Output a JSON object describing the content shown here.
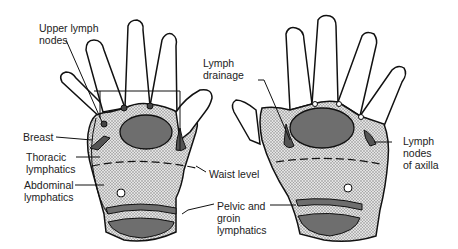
{
  "diagram": {
    "left_hand_labels": {
      "upper_lymph_nodes": "Upper lymph\nnodes",
      "breast": "Breast",
      "thoracic_lymphatics": "Thoracic\nlymphatics",
      "abdominal_lymphatics": "Abdominal\nlymphatics"
    },
    "center_labels": {
      "lymph_drainage": "Lymph\ndrainage",
      "waist_level": "Waist level",
      "pelvic_groin": "Pelvic and\ngroin\nlymphatics"
    },
    "right_hand_labels": {
      "lymph_nodes_axilla": "Lymph\nnodes\nof axilla"
    },
    "colors": {
      "outline": "#111111",
      "stipple": "#bdbdbd",
      "dark_region": "#6e6e6e",
      "background": "#ffffff"
    }
  }
}
